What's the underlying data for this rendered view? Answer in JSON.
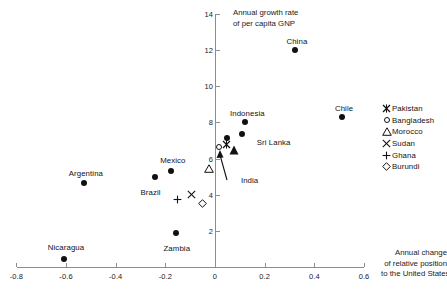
{
  "chart_data": {
    "type": "scatter",
    "title": "",
    "xlabel": "Annual change of relative position to the United States",
    "ylabel": "Annual growth rate of per capita GNP",
    "xlim": [
      -0.8,
      0.6
    ],
    "ylim": [
      0,
      14
    ],
    "xticks": [
      "-0.8",
      "-0.6",
      "-0.4",
      "-0.2",
      "0",
      "0.2",
      "0.4",
      "0.6"
    ],
    "xtick_values": [
      -0.8,
      -0.6,
      -0.4,
      -0.2,
      0,
      0.2,
      0.4,
      0.6
    ],
    "yticks": [
      "2",
      "4",
      "6",
      "8",
      "10",
      "12",
      "14"
    ],
    "ytick_values": [
      2,
      4,
      6,
      8,
      10,
      12,
      14
    ],
    "grid": false,
    "legend_position": "right",
    "points": [
      {
        "name": "China",
        "x": 0.33,
        "y": 11.9,
        "marker": "filled-circle",
        "label": "China",
        "label_dx": 0,
        "label_dy": -11
      },
      {
        "name": "Chile",
        "x": 0.52,
        "y": 8.2,
        "marker": "filled-circle",
        "label": "Chile",
        "label_dx": 0,
        "label_dy": -11
      },
      {
        "name": "Indonesia",
        "x": 0.13,
        "y": 7.9,
        "marker": "filled-circle",
        "label": "Indonesia",
        "label_dx": 0,
        "label_dy": -11
      },
      {
        "name": "Sri Lanka",
        "x": 0.115,
        "y": 7.25,
        "marker": "filled-circle",
        "label": "Sri Lanka",
        "label_dx": 30,
        "label_dy": 6
      },
      {
        "name": "Unlabeled1",
        "x": 0.055,
        "y": 7.0,
        "marker": "filled-circle",
        "label": "",
        "label_dx": 0,
        "label_dy": 0
      },
      {
        "name": "India",
        "x": 0.075,
        "y": 6.5,
        "marker": "filled-triangle",
        "label": "India",
        "label_dx": 16,
        "label_dy": 30
      },
      {
        "name": "Pakistan",
        "x": 0.045,
        "y": 6.75,
        "marker": "star",
        "label": "",
        "label_dx": 0,
        "label_dy": 0
      },
      {
        "name": "Bangladesh",
        "x": 0.025,
        "y": 6.55,
        "marker": "open-circle",
        "label": "",
        "label_dx": 0,
        "label_dy": 0
      },
      {
        "name": "Mexico",
        "x": -0.17,
        "y": 5.2,
        "marker": "filled-circle",
        "label": "Mexico",
        "label_dx": 0,
        "label_dy": -13
      },
      {
        "name": "Brazil",
        "x": -0.235,
        "y": 4.85,
        "marker": "filled-circle",
        "label": "Brazil",
        "label_dx": -6,
        "label_dy": 13
      },
      {
        "name": "Argentina",
        "x": -0.52,
        "y": 4.55,
        "marker": "filled-circle",
        "label": "Argentina",
        "label_dx": 0,
        "label_dy": -12
      },
      {
        "name": "Morocco",
        "x": -0.025,
        "y": 5.45,
        "marker": "open-triangle",
        "label": "",
        "label_dx": 0,
        "label_dy": 0
      },
      {
        "name": "Sudan",
        "x": -0.095,
        "y": 4.0,
        "marker": "x-cross",
        "label": "",
        "label_dx": 0,
        "label_dy": 0
      },
      {
        "name": "Ghana",
        "x": -0.15,
        "y": 3.7,
        "marker": "plus",
        "label": "",
        "label_dx": 0,
        "label_dy": 0
      },
      {
        "name": "Burundi",
        "x": -0.05,
        "y": 3.5,
        "marker": "open-diamond",
        "label": "",
        "label_dx": 0,
        "label_dy": 0
      },
      {
        "name": "Zambia",
        "x": -0.15,
        "y": 1.75,
        "marker": "filled-circle",
        "label": "Zambia",
        "label_dx": -1,
        "label_dy": 13
      },
      {
        "name": "Nicaragua",
        "x": -0.6,
        "y": 0.35,
        "marker": "filled-circle",
        "label": "Nicaragua",
        "label_dx": 0,
        "label_dy": -14
      }
    ],
    "legend": [
      {
        "label": "Pakistan",
        "marker": "star"
      },
      {
        "label": "Bangladesh",
        "marker": "open-circle"
      },
      {
        "label": "Morocco",
        "marker": "open-triangle"
      },
      {
        "label": "Sudan",
        "marker": "x-cross"
      },
      {
        "label": "Ghana",
        "marker": "plus"
      },
      {
        "label": "Burundi",
        "marker": "open-diamond"
      }
    ],
    "annotations": [
      {
        "text": "India",
        "points_to": "India"
      }
    ]
  },
  "axis": {
    "y_title_line1": "Annual growth rate",
    "y_title_line2": "of per capita GNP",
    "x_title_line1": "Annual change",
    "x_title_line2": "of relative position",
    "x_title_line3": "to the United States"
  },
  "colors": {
    "marker": "#111111",
    "axis": "#8c8c8c",
    "text": "#1a1a1a",
    "background": "#ffffff"
  }
}
